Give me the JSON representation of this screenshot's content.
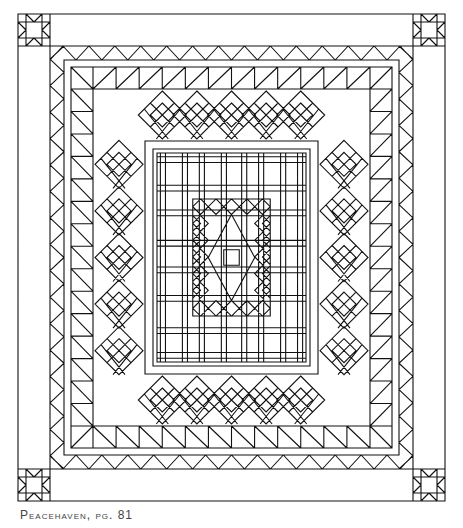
{
  "caption": "Peacehaven, pg. 81",
  "diagram": {
    "type": "quilt-line-drawing",
    "outer_border": {
      "x": 18,
      "y": 14,
      "w": 427,
      "h": 487
    },
    "corner_block_size": 32,
    "corner_block": "sawtooth-star",
    "borders": [
      "plain",
      "flying-geese",
      "half-square-triangles",
      "star-on-point-row",
      "half-square-triangles",
      "plain",
      "plaid-lattice",
      "star-on-point-frame"
    ],
    "star_on_point_count": {
      "top": 5,
      "bottom": 5,
      "left": 5,
      "right": 5
    },
    "line_color": "#111111",
    "background": "#ffffff"
  }
}
